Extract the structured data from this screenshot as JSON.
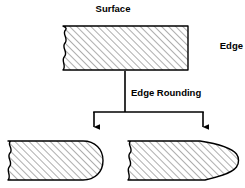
{
  "diagram": {
    "title_label": "Surface",
    "edge_label": "Edge",
    "process_label": "Edge Rounding",
    "colors": {
      "background": "#ffffff",
      "outline": "#000000",
      "hatch": "#9a9a9a",
      "hatch_fill": "#ffffff",
      "text": "#000000",
      "connector": "#000000"
    },
    "labels": {
      "surface": {
        "text": "Surface",
        "x": 113,
        "y": 12,
        "anchor": "middle"
      },
      "edge": {
        "text": "Edge",
        "x": 243,
        "y": 49,
        "anchor": "end"
      },
      "edge_rounding": {
        "text": "Edge Rounding",
        "x": 131,
        "y": 96,
        "anchor": "start"
      }
    },
    "shapes": {
      "top_block": {
        "name": "square-edge-block",
        "left": 63,
        "right": 188,
        "top": 26,
        "bottom": 70,
        "end_style": "square",
        "break_side": "left"
      },
      "bottom_left_block": {
        "name": "radiused-edge-block",
        "left": 8,
        "right": 103,
        "top": 141,
        "bottom": 180,
        "end_style": "full-radius",
        "break_side": "left"
      },
      "bottom_right_block": {
        "name": "tapered-edge-block",
        "left": 128,
        "right": 238,
        "top": 141,
        "bottom": 180,
        "end_style": "taper-to-radius",
        "break_side": "left"
      }
    },
    "connector": {
      "name": "branching-arrow",
      "trunk_x": 125,
      "trunk_top": 71,
      "bar_y": 112,
      "bar_left": 94,
      "bar_right": 203,
      "arrow_tip_y": 133,
      "arrow_count": 2
    }
  }
}
